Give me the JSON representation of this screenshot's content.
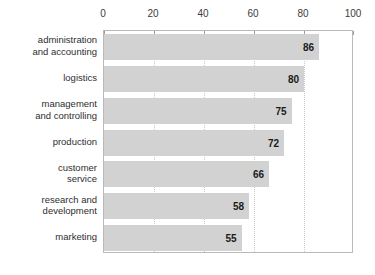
{
  "chart_data": {
    "type": "bar",
    "orientation": "horizontal",
    "title": "",
    "subtitle": "",
    "xlabel": "",
    "ylabel": "",
    "xlim": [
      0,
      100
    ],
    "grid": true,
    "legend": false,
    "x_ticks": [
      "0",
      "20",
      "40",
      "60",
      "80",
      "100"
    ],
    "x_tick_values": [
      0,
      20,
      40,
      60,
      80,
      100
    ],
    "categories": [
      "administration\nand accounting",
      "logistics",
      "management\nand controlling",
      "production",
      "customer\nservice",
      "research and\ndevelopment",
      "marketing"
    ],
    "values": [
      86,
      80,
      75,
      72,
      66,
      58,
      55
    ],
    "data_labels": [
      "86",
      "80",
      "75",
      "72",
      "66",
      "58",
      "55"
    ],
    "colors": {
      "bar_fill": "#d2d2d2",
      "plot_border": "#b9b9b9",
      "gridline": "#c9c9c9",
      "label_text": "#2e2e2e",
      "value_text": "#1a1a1a",
      "background": "#ffffff"
    }
  }
}
